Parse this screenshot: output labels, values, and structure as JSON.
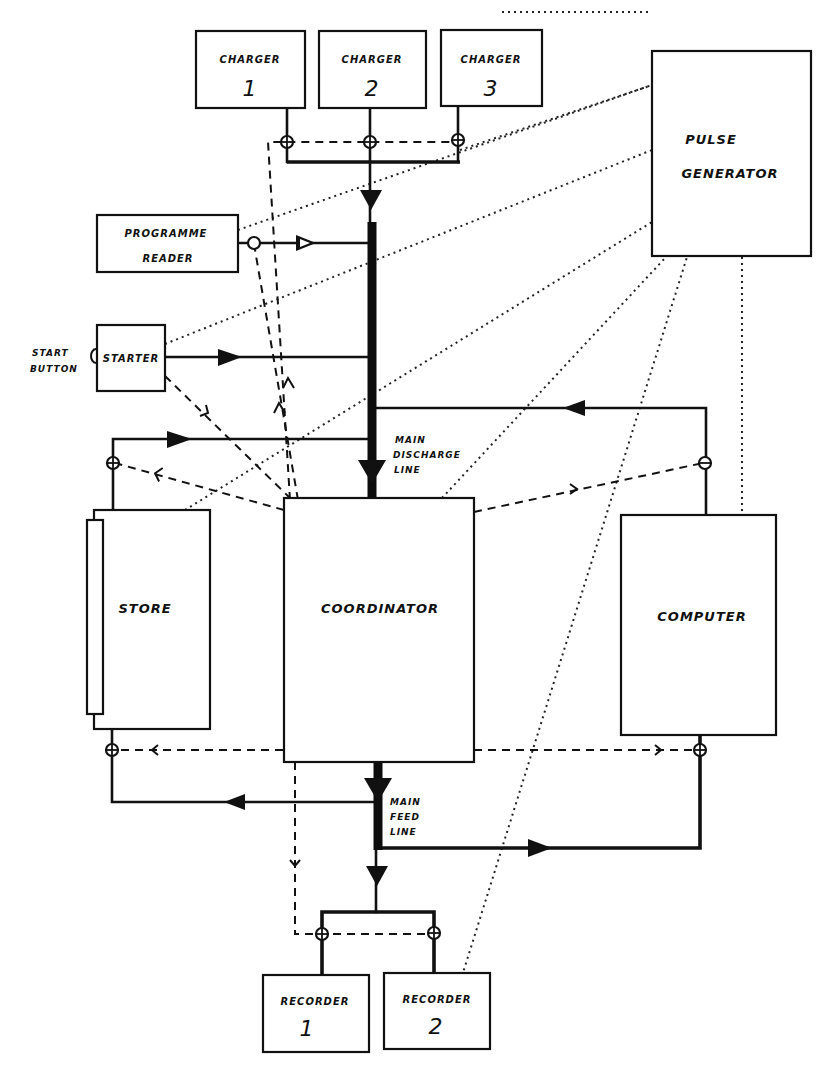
{
  "diagram": {
    "title": "",
    "blocks": {
      "charger1": {
        "line1": "CHARGER",
        "line2": "1"
      },
      "charger2": {
        "line1": "CHARGER",
        "line2": "2"
      },
      "charger3": {
        "line1": "CHARGER",
        "line2": "3"
      },
      "pulse_generator": {
        "line1": "PULSE",
        "line2": "GENERATOR"
      },
      "programme_reader": {
        "line1": "PROGRAMME",
        "line2": "READER"
      },
      "starter": {
        "label": "STARTER"
      },
      "store": {
        "label": "STORE"
      },
      "coordinator": {
        "label": "COORDINATOR"
      },
      "computer": {
        "label": "COMPUTER"
      },
      "recorder1": {
        "line1": "RECORDER",
        "line2": "1"
      },
      "recorder2": {
        "line1": "RECORDER",
        "line2": "2"
      }
    },
    "annotations": {
      "start_button": {
        "line1": "START",
        "line2": "BUTTON"
      },
      "main_discharge_line": {
        "line1": "MAIN",
        "line2": "DISCHARGE",
        "line3": "LINE"
      },
      "main_feed_line": {
        "line1": "MAIN",
        "line2": "FEED",
        "line3": "LINE"
      }
    },
    "line_styles": {
      "solid": "data path",
      "thick_solid": "main discharge / main feed line",
      "dashed": "control signal",
      "dotted": "timing pulses from pulse generator"
    },
    "connections": [
      {
        "from": "charger1",
        "to": "main_discharge_line",
        "style": "solid"
      },
      {
        "from": "charger2",
        "to": "main_discharge_line",
        "style": "solid"
      },
      {
        "from": "charger3",
        "to": "main_discharge_line",
        "style": "solid"
      },
      {
        "from": "programme_reader",
        "to": "main_discharge_line",
        "style": "solid"
      },
      {
        "from": "starter",
        "to": "main_discharge_line",
        "style": "solid"
      },
      {
        "from": "store",
        "to": "main_discharge_line",
        "style": "solid"
      },
      {
        "from": "computer",
        "to": "main_discharge_line",
        "style": "solid"
      },
      {
        "from": "main_discharge_line",
        "to": "coordinator",
        "style": "thick_solid"
      },
      {
        "from": "coordinator",
        "to": "main_feed_line",
        "style": "thick_solid"
      },
      {
        "from": "main_feed_line",
        "to": "store",
        "style": "solid"
      },
      {
        "from": "main_feed_line",
        "to": "computer",
        "style": "solid"
      },
      {
        "from": "main_feed_line",
        "to": "recorder1",
        "style": "solid"
      },
      {
        "from": "main_feed_line",
        "to": "recorder2",
        "style": "solid"
      },
      {
        "from": "starter",
        "to": "coordinator",
        "style": "dashed"
      },
      {
        "from": "coordinator",
        "to": "chargers",
        "style": "dashed"
      },
      {
        "from": "coordinator",
        "to": "programme_reader",
        "style": "dashed"
      },
      {
        "from": "coordinator",
        "to": "store",
        "style": "dashed"
      },
      {
        "from": "coordinator",
        "to": "computer",
        "style": "dashed"
      },
      {
        "from": "coordinator",
        "to": "recorders",
        "style": "dashed"
      },
      {
        "from": "pulse_generator",
        "to": "all_units",
        "style": "dotted"
      }
    ]
  }
}
